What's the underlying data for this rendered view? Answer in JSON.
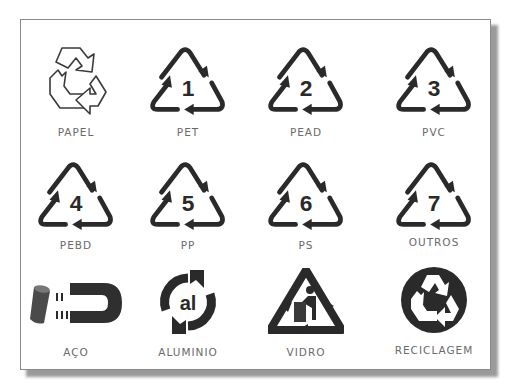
{
  "colors": {
    "ink": "#2a2a2a",
    "label": "#6a6a6a",
    "frame": "#8a8a8a"
  },
  "symbols": [
    {
      "label": "PAPEL",
      "icon": "recycle-outline-icon",
      "number": ""
    },
    {
      "label": "PET",
      "icon": "resin-triangle-icon",
      "number": "1"
    },
    {
      "label": "PEAD",
      "icon": "resin-triangle-icon",
      "number": "2"
    },
    {
      "label": "PVC",
      "icon": "resin-triangle-icon",
      "number": "3"
    },
    {
      "label": "PEBD",
      "icon": "resin-triangle-icon",
      "number": "4"
    },
    {
      "label": "PP",
      "icon": "resin-triangle-icon",
      "number": "5"
    },
    {
      "label": "PS",
      "icon": "resin-triangle-icon",
      "number": "6"
    },
    {
      "label": "OUTROS",
      "icon": "resin-triangle-icon",
      "number": "7"
    },
    {
      "label": "AÇO",
      "icon": "magnet-can-icon",
      "number": ""
    },
    {
      "label": "ALUMINIO",
      "icon": "aluminium-cycle-icon",
      "number": "",
      "glyph": "al"
    },
    {
      "label": "VIDRO",
      "icon": "glass-bin-triangle-icon",
      "number": ""
    },
    {
      "label": "RECICLAGEM",
      "icon": "recycle-circle-icon",
      "number": ""
    }
  ]
}
